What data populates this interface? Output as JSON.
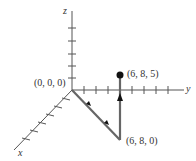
{
  "diagram": {
    "type": "3d-coordinate-axes",
    "axes": {
      "x": {
        "label": "x"
      },
      "y": {
        "label": "y"
      },
      "z": {
        "label": "z"
      }
    },
    "points": [
      {
        "id": "origin",
        "label": "(0, 0, 0)"
      },
      {
        "id": "p1",
        "label": "(6, 8, 0)"
      },
      {
        "id": "p2",
        "label": "(6, 8, 5)"
      }
    ],
    "path": [
      "(0, 0, 0)",
      "(6, 8, 0)",
      "(6, 8, 5)"
    ],
    "colors": {
      "axis": "#555555",
      "path": "#666666",
      "point": "#111111",
      "text": "#333333"
    }
  }
}
